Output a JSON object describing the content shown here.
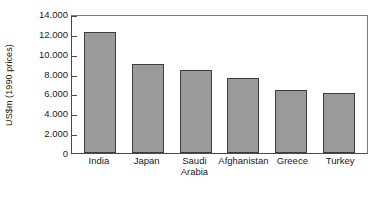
{
  "chart_data": {
    "type": "bar",
    "title": "",
    "xlabel": "",
    "ylabel": "US$m (1990 prices)",
    "categories": [
      "India",
      "Japan",
      "Saudi Arabia",
      "Afghanistan",
      "Greece",
      "Turkey"
    ],
    "category_lines": [
      [
        "India"
      ],
      [
        "Japan"
      ],
      [
        "Saudi",
        "Arabia"
      ],
      [
        "Afghanistan"
      ],
      [
        "Greece"
      ],
      [
        "Turkey"
      ]
    ],
    "values": [
      12200,
      9000,
      8400,
      7600,
      6300,
      6000
    ],
    "value_labels": [
      "12.200",
      "9.000",
      "8.400",
      "7.600",
      "6.300",
      "6.000"
    ],
    "ylim": [
      0,
      14000
    ],
    "ytick_values": [
      0,
      2000,
      4000,
      6000,
      8000,
      10000,
      12000,
      14000
    ],
    "ytick_labels": [
      "0",
      "2.000",
      "4.000",
      "6.000",
      "8.000",
      "10.000",
      "12.000",
      "14.000"
    ],
    "grid": false,
    "legend": false,
    "legend_position": "none",
    "bar_color": "#9a9a9a",
    "bar_border_color": "#3d3d3d",
    "axis_color": "#4a4a4a",
    "frame_color": "#7d7d7d",
    "background_color": "#ffffff",
    "decimal_separator_note": "thousands separated by period"
  }
}
